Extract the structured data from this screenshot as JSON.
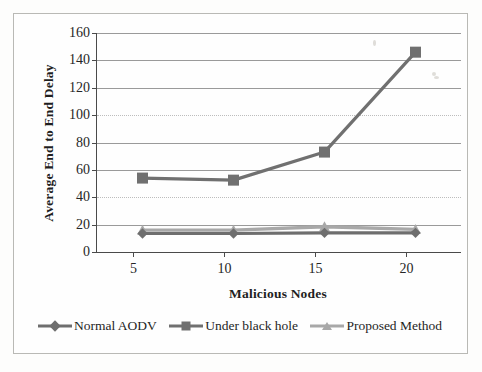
{
  "chart_data": {
    "type": "line",
    "title": "",
    "xlabel": "Malicious Nodes",
    "ylabel": "Average End to End Delay",
    "x": [
      5,
      10,
      15,
      20
    ],
    "categories": [
      "5",
      "10",
      "15",
      "20"
    ],
    "xlim": [
      2.5,
      22.5
    ],
    "ylim": [
      0,
      160
    ],
    "ytick_labels": [
      "0",
      "20",
      "40",
      "60",
      "80",
      "100",
      "120",
      "140",
      "160"
    ],
    "ytick_values": [
      0,
      20,
      40,
      60,
      80,
      100,
      120,
      140,
      160
    ],
    "xtick_labels": [
      "5",
      "10",
      "15",
      "20"
    ],
    "grid": "horizontal",
    "legend_position": "bottom",
    "series": [
      {
        "name": "Normal AODV",
        "marker": "diamond",
        "color": "#6e6e6e",
        "values": [
          13.5,
          13.5,
          14,
          14
        ]
      },
      {
        "name": "Under black hole",
        "marker": "square",
        "color": "#707070",
        "values": [
          54,
          52.5,
          73,
          146
        ]
      },
      {
        "name": "Proposed Method",
        "marker": "triangle",
        "color": "#a8a8a8",
        "values": [
          16,
          16,
          18.5,
          16.5
        ]
      }
    ]
  },
  "legend": {
    "items": [
      {
        "label": "Normal AODV",
        "marker": "diamond-marker",
        "color": "#6e6e6e"
      },
      {
        "label": "Under black hole",
        "marker": "square-marker",
        "color": "#707070"
      },
      {
        "label": "Proposed Method",
        "marker": "triangle-marker",
        "color": "#a8a8a8"
      }
    ]
  },
  "axes": {
    "y_title": "Average End to End Delay",
    "x_title": "Malicious Nodes"
  }
}
